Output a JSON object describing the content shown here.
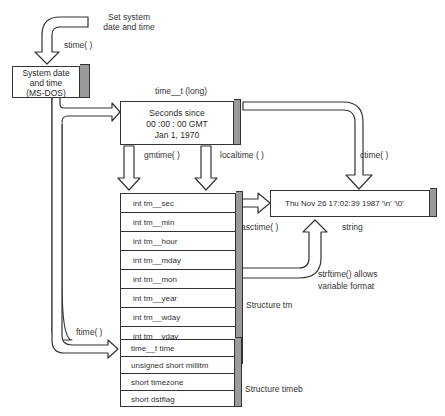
{
  "diagram": {
    "title_top": "Set system date and time",
    "title_top_lines": [
      "Set system",
      "date and time"
    ],
    "functions": {
      "stime": "stime( )",
      "gmtime": "gmtime( )",
      "localtime": "localtime ( )",
      "ctime": "ctime( )",
      "asctime": "asctime( )",
      "ftime": "ftime( )",
      "strftime_lines": [
        "strftime() allows",
        "variable format"
      ]
    },
    "system_box": {
      "lines": [
        "System date",
        "and time",
        "(MS-DOS)"
      ]
    },
    "time_t_box": {
      "label": "time__t (long)",
      "lines": [
        "Seconds since",
        "00 :00 : 00 GMT",
        "Jan 1, 1970"
      ]
    },
    "string_box": {
      "text": "Thu Nov 26 17:02:39 1987 '\\n' '\\0'",
      "caption": "string"
    },
    "structure_tm": {
      "caption": "Structure tm",
      "fields": [
        "int tm__sec",
        "int tm__min",
        "int tm__hour",
        "int tm__mday",
        "int tm__mon",
        "int tm__year",
        "int tm__wday",
        "int tm__yday",
        "int tm__isdst"
      ]
    },
    "structure_timeb": {
      "caption": "Structure timeb",
      "fields": [
        "time__t time",
        "unsigned short millitm",
        "short timezone",
        "short dstflag"
      ]
    },
    "colors": {
      "line": "#333333",
      "shade": "#9a9a9a",
      "background": "#ffffff"
    }
  }
}
